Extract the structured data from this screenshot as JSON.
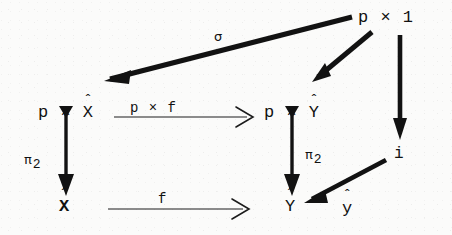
{
  "diagram": {
    "kind": "commutative-diagram",
    "background_color": "#fbfbfa",
    "ink_color": "#111111",
    "nodes": [
      {
        "id": "top_right",
        "text": "p × 1",
        "base": "p × 1",
        "hat_over": "none"
      },
      {
        "id": "mid_left",
        "text": "p × X̂",
        "prefix": "p × ",
        "base": "X",
        "hat_over": "X"
      },
      {
        "id": "mid_right",
        "text": "p × Ŷ",
        "prefix": "p × ",
        "base": "Y",
        "hat_over": "Y"
      },
      {
        "id": "right_i",
        "text": "i",
        "base": "i",
        "hat_over": "none"
      },
      {
        "id": "bottom_left",
        "text": "X̂",
        "base": "X",
        "hat_over": "X"
      },
      {
        "id": "bottom_right",
        "text": "Ŷ",
        "base": "Y",
        "hat_over": "Y"
      },
      {
        "id": "bottom_right_y",
        "text": "ŷ",
        "base": "y",
        "hat_over": "y"
      }
    ],
    "arrow_labels": [
      {
        "id": "sigma",
        "text": "σ",
        "for_arrow": "top_right_to_mid_left"
      },
      {
        "id": "p_times_f",
        "text": "p × f",
        "for_arrow": "mid_left_to_mid_right"
      },
      {
        "id": "pi2_left",
        "text": "π",
        "sub": "2",
        "for_arrow": "mid_left_to_bottom_left"
      },
      {
        "id": "pi2_right",
        "text": "π",
        "sub": "2",
        "for_arrow": "mid_right_to_bottom_right"
      },
      {
        "id": "f_bottom",
        "text": "f",
        "for_arrow": "bottom_left_to_bottom_right"
      }
    ],
    "arrows": [
      {
        "id": "top_right_to_mid_left",
        "style": "thick",
        "from": "p × 1",
        "to": "p × X̂",
        "label": "σ"
      },
      {
        "id": "top_right_to_mid_right",
        "style": "thick",
        "from": "p × 1",
        "to": "p × Ŷ",
        "label": ""
      },
      {
        "id": "top_right_to_i",
        "style": "thick",
        "from": "p × 1",
        "to": "i",
        "label": ""
      },
      {
        "id": "mid_left_to_mid_right",
        "style": "thin",
        "from": "p × X̂",
        "to": "p × Ŷ",
        "label": "p × f"
      },
      {
        "id": "mid_left_to_bottom_left",
        "style": "thick",
        "from": "p × X̂",
        "to": "X̂",
        "label": "π₂"
      },
      {
        "id": "mid_right_to_bottom_right",
        "style": "thick",
        "from": "p × Ŷ",
        "to": "Ŷ",
        "label": "π₂"
      },
      {
        "id": "bottom_left_to_bottom_right",
        "style": "thin",
        "from": "X̂",
        "to": "Ŷ",
        "label": "f"
      },
      {
        "id": "y_hat_to_bottom_right",
        "style": "thick",
        "from": "ŷ",
        "to": "Ŷ",
        "label": ""
      }
    ]
  }
}
